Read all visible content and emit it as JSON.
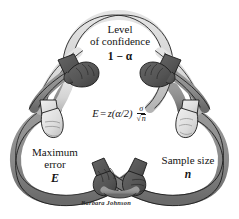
{
  "figure": {
    "background_color": "#ffffff"
  },
  "colors": {
    "loop_light": "#d9d9d9",
    "loop_light_shade": "#bfbfbf",
    "loop_dark": "#8a8a8a",
    "loop_dark_shade": "#6e6e6e",
    "glove_dark": "#5a5a5a",
    "glove_dark_shade": "#474747",
    "glove_light": "#e6e6e6",
    "glove_light_shade": "#c4c4c4",
    "outline": "#1b1b1b",
    "text": "#141414"
  },
  "loops": [
    {
      "id": "confidence",
      "position": "top",
      "line1": "Level",
      "line2": "of confidence",
      "line3": "1 − α"
    },
    {
      "id": "maximum-error",
      "position": "bottom-left",
      "line1": "Maximum",
      "line2": "error",
      "line3": "E"
    },
    {
      "id": "sample-size",
      "position": "bottom-right",
      "line1": "Sample size",
      "line2": "",
      "line3": "n"
    }
  ],
  "formula": {
    "full": "E = z(α/2) σ/√n",
    "lhs": "E",
    "equals": "=",
    "z_term": "z(α/2)",
    "numerator": "σ",
    "denominator": "n",
    "radical": "√"
  },
  "signature": {
    "artist": "Barbara Johnson"
  }
}
